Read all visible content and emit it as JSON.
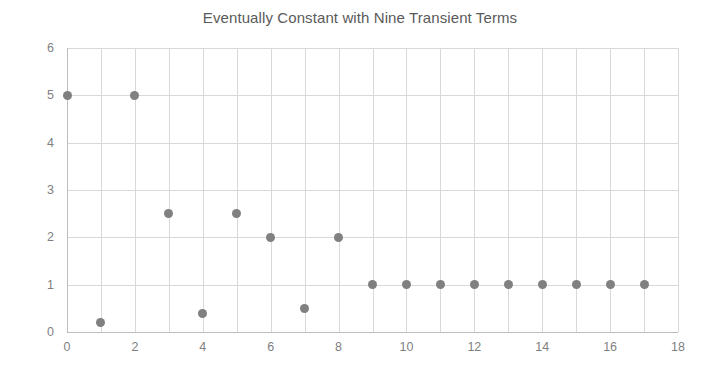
{
  "chart_data": {
    "type": "scatter",
    "title": "Eventually Constant with Nine Transient Terms",
    "xlabel": "",
    "ylabel": "",
    "xlim": [
      0,
      18
    ],
    "ylim": [
      0,
      6
    ],
    "x_ticks": [
      0,
      2,
      4,
      6,
      8,
      10,
      12,
      14,
      16,
      18
    ],
    "x_tick_labels": [
      "0",
      "2",
      "4",
      "6",
      "8",
      "10",
      "12",
      "14",
      "16",
      "18"
    ],
    "y_ticks": [
      0,
      1,
      2,
      3,
      4,
      5,
      6
    ],
    "y_tick_labels": [
      "0",
      "1",
      "2",
      "3",
      "4",
      "5",
      "6"
    ],
    "x_gridlines": [
      0,
      1,
      2,
      3,
      4,
      5,
      6,
      7,
      8,
      9,
      10,
      11,
      12,
      13,
      14,
      15,
      16,
      17,
      18
    ],
    "y_gridlines": [
      0,
      1,
      2,
      3,
      4,
      5,
      6
    ],
    "grid": true,
    "legend": false,
    "marker_color": "#808080",
    "grid_color": "#d9d9d9",
    "title_color": "#5a5a5a",
    "tick_label_color": "#7f7f7f",
    "x": [
      0,
      1,
      2,
      3,
      4,
      5,
      6,
      7,
      8,
      9,
      10,
      11,
      12,
      13,
      14,
      15,
      16,
      17
    ],
    "values": [
      5,
      0.2,
      5,
      2.5,
      0.4,
      2.5,
      2,
      0.5,
      2,
      1,
      1,
      1,
      1,
      1,
      1,
      1,
      1,
      1
    ],
    "annotations": []
  }
}
